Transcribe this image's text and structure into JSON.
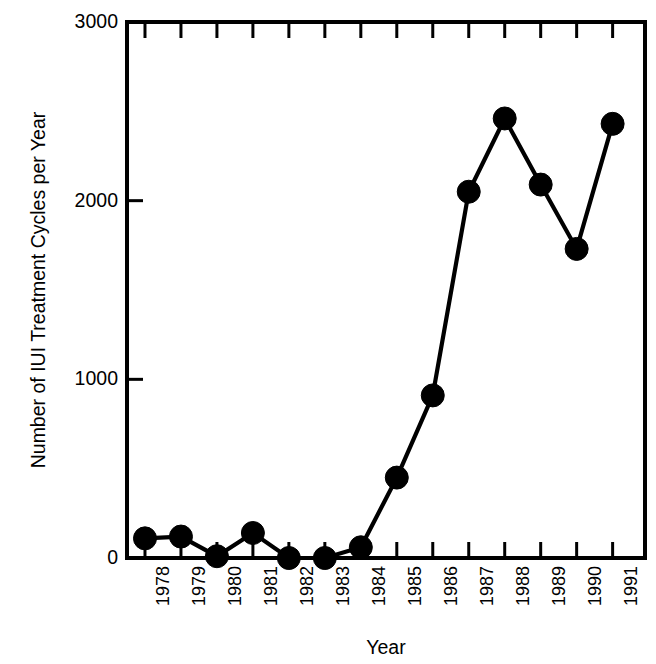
{
  "chart_data": {
    "type": "line",
    "title": "",
    "xlabel": "Year",
    "ylabel": "Number of IUI Treatment Cycles per Year",
    "categories": [
      "1978",
      "1979",
      "1980",
      "1981",
      "1982",
      "1983",
      "1984",
      "1985",
      "1986",
      "1987",
      "1988",
      "1989",
      "1990",
      "1991"
    ],
    "values": [
      110,
      120,
      10,
      140,
      0,
      0,
      60,
      450,
      910,
      2050,
      2460,
      2090,
      1730,
      2430
    ],
    "x": [
      1978,
      1979,
      1980,
      1981,
      1982,
      1983,
      1984,
      1985,
      1986,
      1987,
      1988,
      1989,
      1990,
      1991
    ],
    "xlim": [
      1977.5,
      1991.9
    ],
    "ylim": [
      0,
      3000
    ],
    "yticks": [
      0,
      1000,
      2000,
      3000
    ],
    "ytick_labels": [
      "0",
      "1000",
      "2000",
      "3000"
    ],
    "xtick_labels": [
      "1978",
      "1979",
      "1980",
      "1981",
      "1982",
      "1983",
      "1984",
      "1985",
      "1986",
      "1987",
      "1988",
      "1989",
      "1990",
      "1991"
    ],
    "grid": false,
    "legend": null,
    "marker": "filled-circle",
    "line_color": "#000000",
    "marker_color": "#000000",
    "background_color": "#ffffff",
    "frame": "box",
    "annotations": []
  },
  "axes": {
    "ylabel_text": "Number of IUI Treatment Cycles per Year",
    "xlabel_text": "Year"
  }
}
